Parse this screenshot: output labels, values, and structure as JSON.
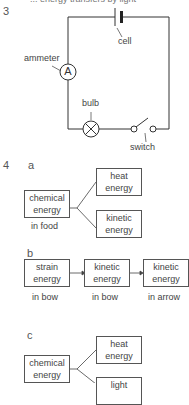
{
  "header": {
    "cutoff_text": "... energy transfers by light"
  },
  "question3": {
    "number": "3",
    "labels": {
      "cell": "cell",
      "ammeter": "ammeter",
      "ammeter_symbol": "A",
      "bulb": "bulb",
      "switch": "switch"
    }
  },
  "question4": {
    "number": "4",
    "parts": [
      {
        "letter": "a",
        "source": {
          "line1": "chemical",
          "line2": "energy",
          "caption": "in food"
        },
        "outputs": [
          {
            "line1": "heat",
            "line2": "energy"
          },
          {
            "line1": "kinetic",
            "line2": "energy"
          }
        ]
      },
      {
        "letter": "b",
        "chain": [
          {
            "line1": "strain",
            "line2": "energy",
            "caption": "in bow"
          },
          {
            "line1": "kinetic",
            "line2": "energy",
            "caption": "in bow"
          },
          {
            "line1": "kinetic",
            "line2": "energy",
            "caption": "in arrow"
          }
        ]
      },
      {
        "letter": "c",
        "source": {
          "line1": "chemical",
          "line2": "energy"
        },
        "outputs": [
          {
            "line1": "heat",
            "line2": "energy"
          },
          {
            "line1": "light",
            "line2": ""
          }
        ]
      }
    ]
  }
}
